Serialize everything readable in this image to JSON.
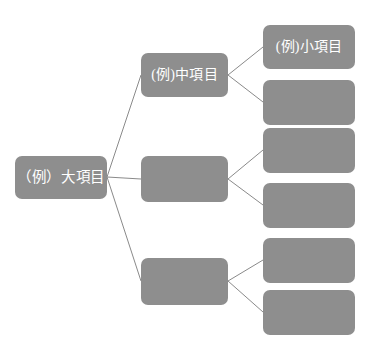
{
  "diagram": {
    "type": "tree",
    "orientation": "left-to-right",
    "background_color": "#ffffff",
    "node_fill_color": "#8e8e8e",
    "node_text_color": "#ffffff",
    "connector_color": "#8a8a8a",
    "levels": [
      {
        "name": "large-item-level",
        "nodes": [
          {
            "id": "root",
            "label": "（例）大項目",
            "x": 15,
            "y": 156,
            "w": 92,
            "h": 43
          }
        ]
      },
      {
        "name": "medium-item-level",
        "nodes": [
          {
            "id": "mid1",
            "label": "(例)中項目",
            "x": 141,
            "y": 53,
            "w": 87,
            "h": 44
          },
          {
            "id": "mid2",
            "label": "",
            "x": 141,
            "y": 156,
            "w": 87,
            "h": 46
          },
          {
            "id": "mid3",
            "label": "",
            "x": 141,
            "y": 258,
            "w": 87,
            "h": 47
          }
        ]
      },
      {
        "name": "small-item-level",
        "nodes": [
          {
            "id": "leaf1",
            "label": "(例)小項目",
            "x": 263,
            "y": 25,
            "w": 92,
            "h": 44
          },
          {
            "id": "leaf2",
            "label": "",
            "x": 263,
            "y": 80,
            "w": 92,
            "h": 45
          },
          {
            "id": "leaf3",
            "label": "",
            "x": 263,
            "y": 128,
            "w": 92,
            "h": 45
          },
          {
            "id": "leaf4",
            "label": "",
            "x": 263,
            "y": 183,
            "w": 92,
            "h": 45
          },
          {
            "id": "leaf5",
            "label": "",
            "x": 263,
            "y": 238,
            "w": 92,
            "h": 45
          },
          {
            "id": "leaf6",
            "label": "",
            "x": 263,
            "y": 290,
            "w": 92,
            "h": 45
          }
        ]
      }
    ],
    "connectors": [
      {
        "from": "root",
        "to": "mid1",
        "x1": 107,
        "y1": 177,
        "x2": 141,
        "y2": 75
      },
      {
        "from": "root",
        "to": "mid2",
        "x1": 107,
        "y1": 177,
        "x2": 141,
        "y2": 179
      },
      {
        "from": "root",
        "to": "mid3",
        "x1": 107,
        "y1": 177,
        "x2": 141,
        "y2": 281
      },
      {
        "from": "mid1",
        "to": "leaf1",
        "x1": 228,
        "y1": 75,
        "x2": 263,
        "y2": 47
      },
      {
        "from": "mid1",
        "to": "leaf2",
        "x1": 228,
        "y1": 75,
        "x2": 263,
        "y2": 102
      },
      {
        "from": "mid2",
        "to": "leaf3",
        "x1": 228,
        "y1": 179,
        "x2": 263,
        "y2": 150
      },
      {
        "from": "mid2",
        "to": "leaf4",
        "x1": 228,
        "y1": 179,
        "x2": 263,
        "y2": 205
      },
      {
        "from": "mid3",
        "to": "leaf5",
        "x1": 228,
        "y1": 281,
        "x2": 263,
        "y2": 260
      },
      {
        "from": "mid3",
        "to": "leaf6",
        "x1": 228,
        "y1": 281,
        "x2": 263,
        "y2": 312
      }
    ]
  }
}
